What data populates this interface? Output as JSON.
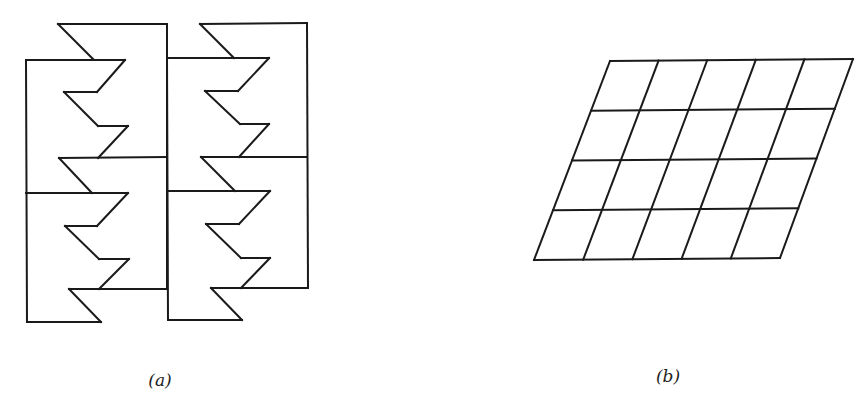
{
  "figure": {
    "stroke_color": "#1a1a1a",
    "background": "#ffffff",
    "panels": [
      {
        "id": "a",
        "label": "(a)",
        "label_pos": [
          160,
          380
        ],
        "description": "Tessellation of four congruent zigzag-edged tiles in a 2x2 arrangement",
        "segments": [
          [
            58,
            24,
            167,
            24
          ],
          [
            58,
            24,
            93,
            59
          ],
          [
            26,
            60,
            125,
            60
          ],
          [
            125,
            60,
            97,
            92
          ],
          [
            97,
            92,
            64,
            92
          ],
          [
            64,
            92,
            98,
            126
          ],
          [
            98,
            126,
            128,
            126
          ],
          [
            128,
            126,
            98,
            158
          ],
          [
            59,
            158,
            167,
            157
          ],
          [
            59,
            158,
            92,
            193
          ],
          [
            26,
            193,
            128,
            193
          ],
          [
            128,
            193,
            97,
            226
          ],
          [
            97,
            226,
            65,
            226
          ],
          [
            65,
            226,
            99,
            259
          ],
          [
            99,
            259,
            129,
            259
          ],
          [
            129,
            259,
            99,
            289
          ],
          [
            69,
            289,
            167,
            289
          ],
          [
            69,
            289,
            101,
            322
          ],
          [
            27,
            322,
            101,
            322
          ],
          [
            26,
            60,
            27,
            322
          ],
          [
            167,
            24,
            167,
            289
          ],
          [
            200,
            24,
            307,
            23
          ],
          [
            200,
            24,
            234,
            58
          ],
          [
            167,
            58,
            269,
            58
          ],
          [
            269,
            58,
            238,
            91
          ],
          [
            238,
            91,
            205,
            91
          ],
          [
            205,
            91,
            240,
            124
          ],
          [
            240,
            124,
            269,
            124
          ],
          [
            269,
            124,
            239,
            157
          ],
          [
            201,
            157,
            307,
            157
          ],
          [
            201,
            157,
            235,
            191
          ],
          [
            167,
            191,
            270,
            191
          ],
          [
            270,
            191,
            239,
            224
          ],
          [
            239,
            224,
            206,
            224
          ],
          [
            206,
            224,
            241,
            258
          ],
          [
            241,
            258,
            270,
            258
          ],
          [
            270,
            258,
            241,
            288
          ],
          [
            211,
            288,
            308,
            288
          ],
          [
            211,
            288,
            242,
            320
          ],
          [
            168,
            320,
            242,
            320
          ],
          [
            167,
            58,
            168,
            320
          ],
          [
            307,
            23,
            308,
            288
          ]
        ]
      },
      {
        "id": "b",
        "label": "(b)",
        "label_pos": [
          668,
          376
        ],
        "description": "Parallelogram lattice grid, 5 columns by 4 rows",
        "grid": {
          "columns": 5,
          "rows": 4,
          "top_left": [
            610,
            61
          ],
          "top_right": [
            853,
            59
          ],
          "bottom_left": [
            534,
            260
          ],
          "bottom_right": [
            780,
            258
          ]
        }
      }
    ]
  }
}
